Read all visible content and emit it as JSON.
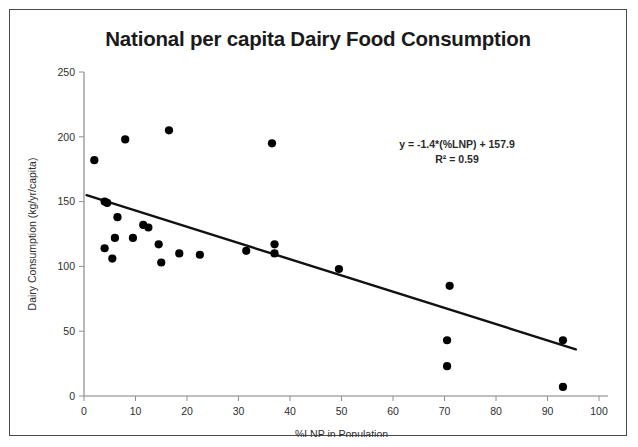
{
  "figure": {
    "title": "National per capita Dairy Food Consumption",
    "border_color": "#4a4a4a",
    "background": "#ffffff"
  },
  "annotation": {
    "equation": "y = -1.4*(%LNP) + 157.9",
    "r_squared": "R² = 0.59"
  },
  "chart_data": {
    "type": "scatter",
    "title": "National per capita Dairy Food Consumption",
    "xlabel": "%LNP in Population",
    "ylabel": "Dairy Consumption (kg/yr/capita)",
    "xlim": [
      0,
      100
    ],
    "ylim": [
      0,
      250
    ],
    "xticks": [
      0,
      10,
      20,
      30,
      40,
      50,
      60,
      70,
      80,
      90,
      100
    ],
    "yticks": [
      0,
      50,
      100,
      150,
      200,
      250
    ],
    "xtick_labels": [
      "0",
      "10",
      "20",
      "30",
      "40",
      "50",
      "60",
      "70",
      "80",
      "90",
      "100"
    ],
    "ytick_labels": [
      "0",
      "50",
      "100",
      "150",
      "200",
      "250"
    ],
    "grid": false,
    "legend": null,
    "marker": {
      "shape": "circle",
      "color": "#000000",
      "size": 7
    },
    "points": [
      {
        "x": 2.0,
        "y": 182
      },
      {
        "x": 4.0,
        "y": 150
      },
      {
        "x": 4.5,
        "y": 149
      },
      {
        "x": 4.0,
        "y": 114
      },
      {
        "x": 8.0,
        "y": 198
      },
      {
        "x": 6.5,
        "y": 138
      },
      {
        "x": 6.0,
        "y": 122
      },
      {
        "x": 5.5,
        "y": 106
      },
      {
        "x": 9.5,
        "y": 122
      },
      {
        "x": 11.5,
        "y": 132
      },
      {
        "x": 12.5,
        "y": 130
      },
      {
        "x": 14.5,
        "y": 117
      },
      {
        "x": 15.0,
        "y": 103
      },
      {
        "x": 16.5,
        "y": 205
      },
      {
        "x": 18.5,
        "y": 110
      },
      {
        "x": 22.5,
        "y": 109
      },
      {
        "x": 31.5,
        "y": 112
      },
      {
        "x": 36.5,
        "y": 195
      },
      {
        "x": 37.0,
        "y": 117
      },
      {
        "x": 37.0,
        "y": 110
      },
      {
        "x": 49.5,
        "y": 98
      },
      {
        "x": 71.0,
        "y": 85
      },
      {
        "x": 70.5,
        "y": 43
      },
      {
        "x": 70.5,
        "y": 23
      },
      {
        "x": 93.0,
        "y": 43
      },
      {
        "x": 93.0,
        "y": 7
      }
    ],
    "trendline": {
      "slope": -1.4,
      "intercept": 157.9,
      "x_start": 0.5,
      "x_end": 95.5,
      "y_start": 155,
      "y_end": 36,
      "r_squared": 0.59,
      "equation_label": "y = -1.4*(%LNP) + 157.9",
      "r2_label": "R² = 0.59"
    }
  }
}
